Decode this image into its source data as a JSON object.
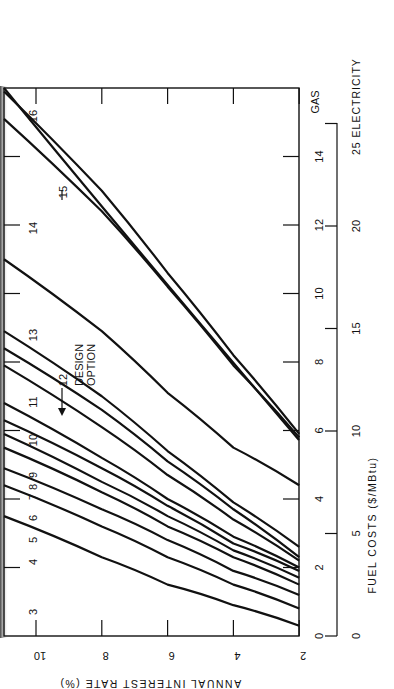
{
  "chart_data": {
    "type": "line",
    "orientation": "rotated-90-ccw",
    "title": "",
    "xlabel": "ANNUAL INTEREST RATE (%)",
    "ylabel": "FUEL COSTS ($/MBtu)",
    "x_ticks": [
      10,
      8,
      6,
      4,
      2
    ],
    "xlim": [
      11,
      2
    ],
    "y_axes": [
      {
        "name": "GAS",
        "ticks": [
          0,
          2,
          4,
          6,
          8,
          10,
          12,
          14,
          16
        ],
        "ylim": [
          0,
          16
        ]
      },
      {
        "name": "ELECTRICITY",
        "ticks": [
          0,
          5,
          10,
          15,
          20,
          25
        ],
        "ylim": [
          0,
          26.6
        ]
      }
    ],
    "zone_labels": [
      "3",
      "4",
      "5",
      "6",
      "7",
      "8",
      "9",
      "10",
      "11",
      "12",
      "13",
      "14",
      "15",
      "16"
    ],
    "annotations": [
      {
        "text": "12",
        "note": "DESIGN OPTION",
        "points_to": "boundary curve 12"
      },
      {
        "text": "15",
        "points_to": "boundary curve 15"
      }
    ],
    "series": [
      {
        "name": "3",
        "x": [
          11,
          8,
          6,
          4,
          2
        ],
        "y": [
          3.5,
          2.3,
          1.5,
          0.9,
          0.3
        ]
      },
      {
        "name": "4",
        "x": [
          11,
          8,
          6,
          4,
          2
        ],
        "y": [
          4.4,
          3.2,
          2.3,
          1.5,
          0.8
        ]
      },
      {
        "name": "5",
        "x": [
          11,
          8,
          6,
          4,
          2
        ],
        "y": [
          4.9,
          3.7,
          2.8,
          1.9,
          1.2
        ]
      },
      {
        "name": "6",
        "x": [
          11,
          8,
          6,
          4,
          2
        ],
        "y": [
          5.5,
          4.2,
          3.2,
          2.3,
          1.5
        ]
      },
      {
        "name": "7",
        "x": [
          11,
          8,
          6,
          4,
          2
        ],
        "y": [
          5.9,
          4.5,
          3.5,
          2.5,
          1.7
        ]
      },
      {
        "name": "8",
        "x": [
          11,
          8,
          6,
          4,
          2
        ],
        "y": [
          6.3,
          4.9,
          3.8,
          2.7,
          1.9
        ]
      },
      {
        "name": "9",
        "x": [
          11,
          8,
          6,
          4,
          2
        ],
        "y": [
          6.8,
          5.2,
          4.0,
          2.9,
          2.0
        ]
      },
      {
        "name": "10",
        "x": [
          11,
          8,
          6,
          4,
          2
        ],
        "y": [
          7.9,
          6.1,
          4.7,
          3.4,
          2.2
        ]
      },
      {
        "name": "11",
        "x": [
          11,
          8,
          6,
          4,
          2
        ],
        "y": [
          8.4,
          6.6,
          5.1,
          3.7,
          2.3
        ]
      },
      {
        "name": "12",
        "x": [
          11,
          8,
          6,
          4,
          2
        ],
        "y": [
          8.9,
          7.0,
          5.4,
          3.9,
          2.6
        ]
      },
      {
        "name": "13",
        "x": [
          11,
          8,
          6,
          4,
          2
        ],
        "y": [
          11.0,
          8.9,
          7.1,
          5.5,
          4.4
        ]
      },
      {
        "name": "14",
        "x": [
          11,
          8,
          6,
          4,
          2
        ],
        "y": [
          15.1,
          12.4,
          10.2,
          7.9,
          5.8
        ]
      },
      {
        "name": "15",
        "x": [
          11,
          8,
          6,
          4,
          2
        ],
        "y": [
          15.9,
          13.0,
          10.6,
          8.2,
          5.9
        ]
      }
    ]
  },
  "labels": {
    "gas_axis": "GAS",
    "electricity_axis": "25 ELECTRICITY",
    "fuel_axis_title": "FUEL COSTS ($/MBtu)",
    "interest_axis_title": "ANNUAL INTEREST RATE (%)",
    "design_option_line1": "DESIGN",
    "design_option_line2": "OPTION",
    "design_option_num": "12",
    "arrow15_num": "15"
  }
}
